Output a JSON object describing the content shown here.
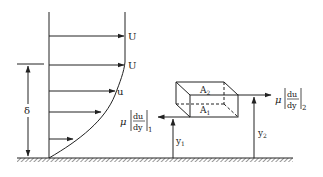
{
  "diagram": {
    "labels": {
      "free_stream_top": "U",
      "free_stream_edge": "U",
      "local_velocity": "u",
      "boundary_layer_thickness": "δ",
      "area_top": "A",
      "area_top_sub": "2",
      "area_bottom": "A",
      "area_bottom_sub": "1",
      "shear_bottom_mu": "μ",
      "shear_bottom_num": "du",
      "shear_bottom_den": "dy",
      "shear_bottom_sub": "1",
      "shear_top_mu": "μ",
      "shear_top_num": "du",
      "shear_top_den": "dy",
      "shear_top_sub": "2",
      "height_1": "y",
      "height_1_sub": "1",
      "height_2": "y",
      "height_2_sub": "2"
    },
    "colors": {
      "line": "#222222",
      "background": "#ffffff"
    }
  }
}
